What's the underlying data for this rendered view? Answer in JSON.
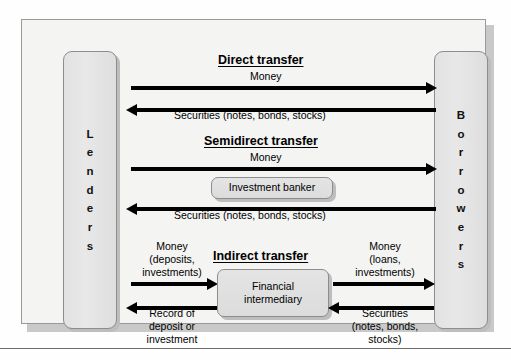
{
  "figure": {
    "parties": {
      "left": {
        "name": "Lenders",
        "letters": [
          "L",
          "e",
          "n",
          "d",
          "e",
          "r",
          "s"
        ]
      },
      "right": {
        "name": "Borrowers",
        "letters": [
          "B",
          "o",
          "r",
          "r",
          "o",
          "w",
          "e",
          "r",
          "s"
        ]
      }
    },
    "sections": {
      "direct": {
        "heading": "Direct transfer",
        "forward_label": "Money",
        "reverse_label": "Securities (notes, bonds, stocks)"
      },
      "semidirect": {
        "heading": "Semidirect transfer",
        "forward_label": "Money",
        "reverse_label": "Securities (notes, bonds, stocks)",
        "intermediary": "Investment banker"
      },
      "indirect": {
        "heading": "Indirect transfer",
        "intermediary": "Financial\nintermediary",
        "intermediary_line1": "Financial",
        "intermediary_line2": "intermediary",
        "left_forward_label": "Money\n(deposits,\ninvestments)",
        "left_forward_line1": "Money",
        "left_forward_line2": "(deposits,",
        "left_forward_line3": "investments)",
        "left_reverse_label": "Record of\ndeposit or\ninvestment",
        "left_reverse_line1": "Record of",
        "left_reverse_line2": "deposit or",
        "left_reverse_line3": "investment",
        "right_forward_label": "Money\n(loans,\ninvestments)",
        "right_forward_line1": "Money",
        "right_forward_line2": "(loans,",
        "right_forward_line3": "investments)",
        "right_reverse_label": "Securities\n(notes, bonds,\nstocks)",
        "right_reverse_line1": "Securities",
        "right_reverse_line2": "(notes, bonds,",
        "right_reverse_line3": "stocks)"
      }
    },
    "colors": {
      "page_background": "#fefefe",
      "frame_background": "#f4f4f3",
      "frame_border": "#9a9a9a",
      "box_fill": "#e2e2e2",
      "box_border": "#8d8d8d",
      "shadow": "#bdbdbd",
      "arrow": "#000000",
      "text": "#000000"
    }
  }
}
